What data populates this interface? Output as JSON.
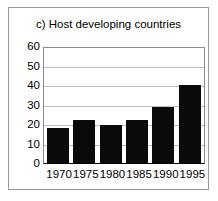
{
  "chart_data": {
    "type": "bar",
    "title": "c) Host developing countries",
    "xlabel": "",
    "ylabel": "",
    "categories": [
      "1970",
      "1975",
      "1980",
      "1985",
      "1990",
      "1995"
    ],
    "values": [
      18,
      22,
      19.5,
      22,
      28.5,
      40
    ],
    "ylim": [
      0,
      60
    ],
    "yticks": [
      "0",
      "10",
      "20",
      "30",
      "40",
      "50",
      "60"
    ],
    "ytick_values": [
      0,
      10,
      20,
      30,
      40,
      50,
      60
    ],
    "grid": true,
    "legend": null,
    "bar_color": "#0a0a0a",
    "gridline_color": "#bfbfbf",
    "frame_color": "#9a9a9a",
    "background_color": "#ffffff"
  }
}
